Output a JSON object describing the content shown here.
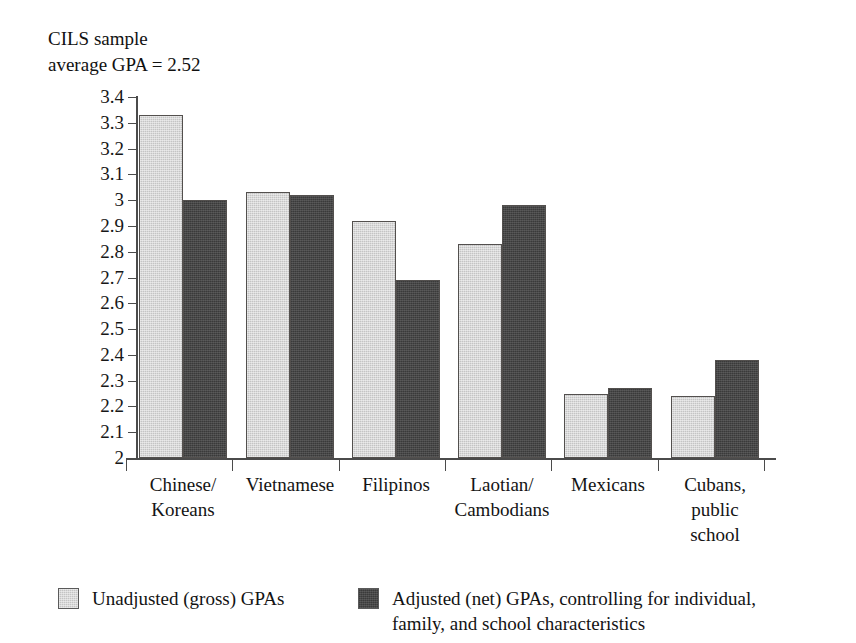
{
  "chart_data": {
    "type": "bar",
    "title": "CILS sample\naverage GPA = 2.52",
    "xlabel": "",
    "ylabel": "",
    "ylim": [
      2,
      3.4
    ],
    "ytick_step": 0.1,
    "grid": false,
    "legend_position": "bottom",
    "categories": [
      "Chinese/\nKoreans",
      "Vietnamese",
      "Filipinos",
      "Laotian/\nCambodians",
      "Mexicans",
      "Cubans,\npublic\nschool"
    ],
    "ytick_labels": [
      "3.4",
      "3.3",
      "3.2",
      "3.1",
      "3",
      "2.9",
      "2.8",
      "2.7",
      "2.6",
      "2.5",
      "2.4",
      "2.3",
      "2.2",
      "2.1",
      "2"
    ],
    "series": [
      {
        "name": "Unadjusted (gross) GPAs",
        "color": "#c4c4c4",
        "values": [
          3.33,
          3.03,
          2.92,
          2.83,
          2.25,
          2.24
        ]
      },
      {
        "name": "Adjusted (net) GPAs, controlling for individual,\nfamily, and school characteristics",
        "color": "#474747",
        "values": [
          3.0,
          3.02,
          2.69,
          2.98,
          2.27,
          2.38
        ]
      }
    ]
  },
  "legend": {
    "entries": [
      {
        "label": "Unadjusted (gross) GPAs",
        "color": "#c4c4c4"
      },
      {
        "label": "Adjusted (net) GPAs, controlling for individual,\nfamily, and school characteristics",
        "color": "#474747"
      }
    ]
  }
}
